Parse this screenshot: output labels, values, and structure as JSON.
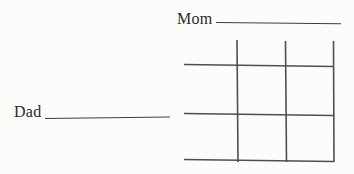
{
  "diagram": {
    "type": "punnett-square",
    "mom": {
      "label": "Mom",
      "blank_value": ""
    },
    "dad": {
      "label": "Dad",
      "blank_value": ""
    },
    "grid": {
      "rows": 2,
      "cols": 2,
      "header_row_open": true,
      "header_col_open": true
    }
  },
  "colors": {
    "background": "#fcfcfa",
    "line": "#4f4f4f",
    "underline": "#3e3e3e",
    "text": "#2a2a2a"
  }
}
